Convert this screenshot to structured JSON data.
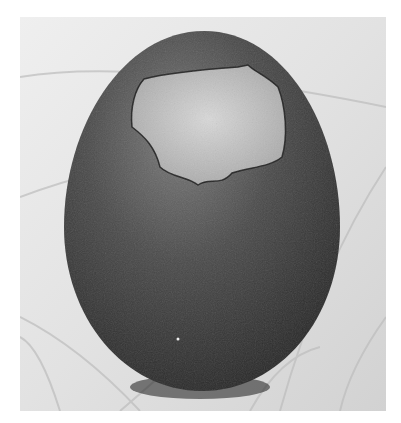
{
  "image": {
    "subject": "dark egg with broken shell revealing light membrane at top, standing on wooden surface",
    "style": "black and white photograph",
    "colors": {
      "background_page": "#ffffff",
      "wood_light": "#e4e4e4",
      "wood_grain": "#b8b8b8",
      "egg_dark": "#3a3a3a",
      "egg_highlight": "#7a7a7a",
      "membrane": "#c8c8c8",
      "shadow": "#1c1c1c"
    }
  }
}
